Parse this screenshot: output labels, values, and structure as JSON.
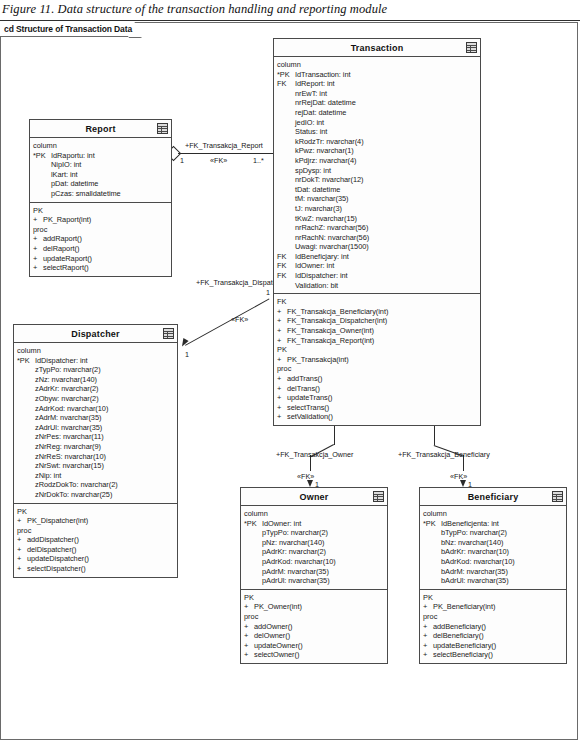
{
  "figure": {
    "caption": "Figure 11. Data structure of the transaction handling and reporting module",
    "frame_label": "cd Structure of Transaction Data"
  },
  "sections": {
    "column": "column",
    "pk": "PK",
    "fk": "FK",
    "proc": "proc",
    "plus": "+",
    "pk_marker": "*PK",
    "fk_marker": "FK"
  },
  "classes": {
    "report": {
      "name": "Report",
      "icon": "table-icon",
      "columns": [
        {
          "key": "*PK",
          "text": "IdRaportu: int"
        },
        {
          "key": "",
          "text": "NipIO: int"
        },
        {
          "key": "",
          "text": "lKart: int"
        },
        {
          "key": "",
          "text": "pDat: datetime"
        },
        {
          "key": "",
          "text": "pCzas: smalldatetime"
        }
      ],
      "pk": [
        "PK_Raport(int)"
      ],
      "proc": [
        "addRaport()",
        "delRaport()",
        "updateRaport()",
        "selectRaport()"
      ]
    },
    "transaction": {
      "name": "Transaction",
      "icon": "table-icon",
      "columns": [
        {
          "key": "*PK",
          "text": "IdTransaction: int"
        },
        {
          "key": "FK",
          "text": "IdReport: int"
        },
        {
          "key": "",
          "text": "nrEwT: int"
        },
        {
          "key": "",
          "text": "nrRejDat: datetime"
        },
        {
          "key": "",
          "text": "rejDat: datetime"
        },
        {
          "key": "",
          "text": "jedIO: int"
        },
        {
          "key": "",
          "text": "Status: int"
        },
        {
          "key": "",
          "text": "kRodzTr: nvarchar(4)"
        },
        {
          "key": "",
          "text": "kPwz: nvarchar(1)"
        },
        {
          "key": "",
          "text": "kPdjrz: nvarchar(4)"
        },
        {
          "key": "",
          "text": "spDysp: int"
        },
        {
          "key": "",
          "text": "nrDokT: nvarchar(12)"
        },
        {
          "key": "",
          "text": "tDat: datetime"
        },
        {
          "key": "",
          "text": "tM: nvarchar(35)"
        },
        {
          "key": "",
          "text": "tJ: nvarchar(3)"
        },
        {
          "key": "",
          "text": "tKwZ: nvarchar(15)"
        },
        {
          "key": "",
          "text": "nrRachZ: nvarchar(56)"
        },
        {
          "key": "",
          "text": "nrRachN: nvarchar(56)"
        },
        {
          "key": "",
          "text": "Uwagi: nvarchar(1500)"
        },
        {
          "key": "FK",
          "text": "IdBeneficjary: int"
        },
        {
          "key": "FK",
          "text": "IdOwner: int"
        },
        {
          "key": "FK",
          "text": "IdDispatcher: int"
        },
        {
          "key": "",
          "text": "Validation: bit"
        }
      ],
      "fk": [
        "FK_Transakcja_Beneficiary(int)",
        "FK_Transakcja_Dispatcher(int)",
        "FK_Transakcja_Owner(int)",
        "FK_Transakcja_Report(int)"
      ],
      "pk": [
        "PK_Transakcja(int)"
      ],
      "proc": [
        "addTrans()",
        "delTrans()",
        "updateTrans()",
        "selectTrans()",
        "setValidation()"
      ]
    },
    "dispatcher": {
      "name": "Dispatcher",
      "icon": "table-icon",
      "columns": [
        {
          "key": "*PK",
          "text": "IdDispatcher: int"
        },
        {
          "key": "",
          "text": "zTypPo: nvarchar(2)"
        },
        {
          "key": "",
          "text": "zNz: nvarchar(140)"
        },
        {
          "key": "",
          "text": "zAdrKr: nvarchar(2)"
        },
        {
          "key": "",
          "text": "zObyw: nvarchar(2)"
        },
        {
          "key": "",
          "text": "zAdrKod: nvarchar(10)"
        },
        {
          "key": "",
          "text": "zAdrM: nvarchar(35)"
        },
        {
          "key": "",
          "text": "zAdrUl: nvarchar(35)"
        },
        {
          "key": "",
          "text": "zNrPes: nvarchar(11)"
        },
        {
          "key": "",
          "text": "zNrReg: nvarchar(9)"
        },
        {
          "key": "",
          "text": "zNrReS: nvarchar(10)"
        },
        {
          "key": "",
          "text": "zNrSwt: nvarchar(15)"
        },
        {
          "key": "",
          "text": "zNip: int"
        },
        {
          "key": "",
          "text": "zRodzDokTo: nvarchar(2)"
        },
        {
          "key": "",
          "text": "zNrDokTo: nvarchar(25)"
        }
      ],
      "pk": [
        "PK_Dispatcher(int)"
      ],
      "proc": [
        "addDispatcher()",
        "delDispatcher()",
        "updateDispatcher()",
        "selectDispatcher()"
      ]
    },
    "owner": {
      "name": "Owner",
      "icon": "table-icon",
      "columns": [
        {
          "key": "*PK",
          "text": "IdOwner: int"
        },
        {
          "key": "",
          "text": "pTypPo: nvarchar(2)"
        },
        {
          "key": "",
          "text": "pNz: nvarchar(140)"
        },
        {
          "key": "",
          "text": "pAdrKr: nvarchar(2)"
        },
        {
          "key": "",
          "text": "pAdrKod: nvarchar(10)"
        },
        {
          "key": "",
          "text": "pAdrM: nvarchar(35)"
        },
        {
          "key": "",
          "text": "pAdrUl: nvarchar(35)"
        }
      ],
      "pk": [
        "PK_Owner(int)"
      ],
      "proc": [
        "addOwner()",
        "delOwner()",
        "updateOwner()",
        "selectOwner()"
      ]
    },
    "beneficiary": {
      "name": "Beneficiary",
      "icon": "table-icon",
      "columns": [
        {
          "key": "*PK",
          "text": "IdBeneficjenta: int"
        },
        {
          "key": "",
          "text": "bTypPo: nvarchar(2)"
        },
        {
          "key": "",
          "text": "bNz: nvarchar(140)"
        },
        {
          "key": "",
          "text": "bAdrKr: nvarchar(10)"
        },
        {
          "key": "",
          "text": "bAdrKod: nvarchar(10)"
        },
        {
          "key": "",
          "text": "bAdrM: nvarchar(35)"
        },
        {
          "key": "",
          "text": "bAdrUl: nvarchar(35)"
        }
      ],
      "pk": [
        "PK_Beneficiary(int)"
      ],
      "proc": [
        "addBeneficiary()",
        "delBeneficiary()",
        "updateBeneficiary()",
        "selectBeneficiary()"
      ]
    }
  },
  "associations": {
    "report_transaction": {
      "label": "+FK_Transakcja_Report",
      "stereotype": "«FK»",
      "source_mult": "1",
      "target_mult": "1..*"
    },
    "dispatcher_transaction": {
      "label": "+FK_Transakcja_Dispatcher",
      "stereotype": "«FK»",
      "source_mult": "1",
      "target_mult": "1"
    },
    "transaction_owner": {
      "label": "+FK_Transakcja_Owner",
      "stereotype": "«FK»",
      "source_mult": "1",
      "target_mult": "1"
    },
    "transaction_beneficiary": {
      "label": "+FK_Transakcja_Beneficiary",
      "stereotype": "«FK»",
      "source_mult": "1",
      "target_mult": "1"
    }
  }
}
